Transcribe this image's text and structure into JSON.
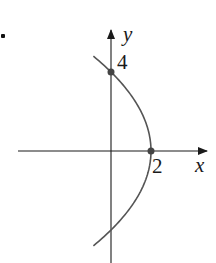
{
  "chart_data": {
    "type": "line",
    "title": "",
    "equation": "x = 2 - y^2/8",
    "xlabel": "x",
    "ylabel": "y",
    "tick_labels": {
      "x": [
        "2"
      ],
      "y": [
        "4"
      ]
    },
    "highlighted_points": [
      {
        "x": 0,
        "y": 4,
        "label": "4"
      },
      {
        "x": 2,
        "y": 0,
        "label": "2"
      }
    ],
    "series": [
      {
        "name": "parabola",
        "points": [
          [
            -1.1,
            4.8
          ],
          [
            -0.5,
            4.47
          ],
          [
            0,
            4
          ],
          [
            0.5,
            3.46
          ],
          [
            1,
            2.83
          ],
          [
            1.5,
            2
          ],
          [
            1.875,
            1
          ],
          [
            2,
            0
          ],
          [
            1.875,
            -1
          ],
          [
            1.5,
            -2
          ],
          [
            1,
            -2.83
          ],
          [
            0.5,
            -3.46
          ],
          [
            0,
            -4
          ],
          [
            -0.5,
            -4.47
          ],
          [
            -1.1,
            -4.8
          ]
        ]
      }
    ],
    "xlim": [
      -4.7,
      4.8
    ],
    "ylim": [
      -5.6,
      6.1
    ],
    "grid": false,
    "legend": null,
    "colors": {
      "axes": "#1a1a1a",
      "curve": "#555555",
      "points": "#444444"
    }
  },
  "labels": {
    "x_axis": "x",
    "y_axis": "y",
    "x_tick": "2",
    "y_tick": "4"
  }
}
